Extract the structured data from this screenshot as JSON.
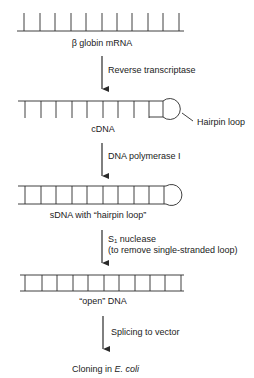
{
  "diagram": {
    "stages": [
      {
        "id": "mrna",
        "label": "β globin mRNA",
        "structure": "single-strand with ticks"
      },
      {
        "id": "cdna",
        "label": "cDNA",
        "structure": "single strand with hairpin loop",
        "callout": "Hairpin loop"
      },
      {
        "id": "sdna",
        "label": "sDNA with “hairpin loop”",
        "structure": "double strand with loop"
      },
      {
        "id": "open",
        "label": "“open” DNA",
        "structure": "double strand ladder"
      },
      {
        "id": "final",
        "label_prefix": "Cloning in ",
        "label_italic": "E. coli"
      }
    ],
    "steps": [
      {
        "label": "Reverse transcriptase"
      },
      {
        "label": "DNA polymerase I"
      },
      {
        "label_s": "S",
        "label_sub": "1",
        "label_rest": " nuclease",
        "label_line2": "(to remove single-stranded loop)"
      },
      {
        "label": "Splicing to vector"
      }
    ],
    "colors": {
      "line": "#2a2a2a",
      "text": "#222222",
      "background": "#ffffff"
    }
  }
}
